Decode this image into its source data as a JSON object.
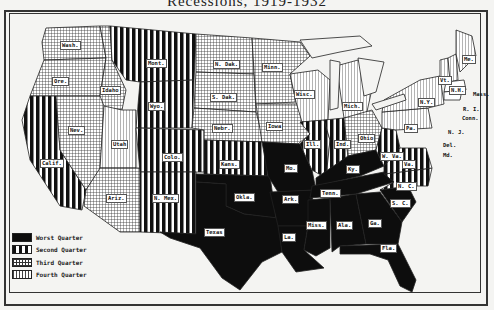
{
  "title": "Recessions, 1919-1932",
  "legend": [
    {
      "key": "worst",
      "label": "Worst Quarter"
    },
    {
      "key": "second",
      "label": "Second Quarter"
    },
    {
      "key": "third",
      "label": "Third Quarter"
    },
    {
      "key": "fourth",
      "label": "Fourth Quarter"
    }
  ],
  "states": [
    {
      "abbr": "Wash.",
      "quarter": "third"
    },
    {
      "abbr": "Ore.",
      "quarter": "third"
    },
    {
      "abbr": "Idaho",
      "quarter": "third"
    },
    {
      "abbr": "Calif.",
      "quarter": "second"
    },
    {
      "abbr": "Nev.",
      "quarter": "third"
    },
    {
      "abbr": "Mont.",
      "quarter": "second"
    },
    {
      "abbr": "Wyo.",
      "quarter": "second"
    },
    {
      "abbr": "Utah",
      "quarter": "fourth"
    },
    {
      "abbr": "Ariz.",
      "quarter": "third"
    },
    {
      "abbr": "Colo.",
      "quarter": "second"
    },
    {
      "abbr": "N. Mex.",
      "quarter": "second"
    },
    {
      "abbr": "N. Dak.",
      "quarter": "third"
    },
    {
      "abbr": "S. Dak.",
      "quarter": "third"
    },
    {
      "abbr": "Nebr.",
      "quarter": "third"
    },
    {
      "abbr": "Kans.",
      "quarter": "second"
    },
    {
      "abbr": "Okla.",
      "quarter": "worst"
    },
    {
      "abbr": "Texas",
      "quarter": "worst"
    },
    {
      "abbr": "Minn.",
      "quarter": "third"
    },
    {
      "abbr": "Iowa",
      "quarter": "third"
    },
    {
      "abbr": "Mo.",
      "quarter": "worst"
    },
    {
      "abbr": "Ark.",
      "quarter": "worst"
    },
    {
      "abbr": "La.",
      "quarter": "worst"
    },
    {
      "abbr": "Wisc.",
      "quarter": "fourth"
    },
    {
      "abbr": "Ill.",
      "quarter": "second"
    },
    {
      "abbr": "Ind.",
      "quarter": "second"
    },
    {
      "abbr": "Mich.",
      "quarter": "fourth"
    },
    {
      "abbr": "Ohio",
      "quarter": "third"
    },
    {
      "abbr": "Ky.",
      "quarter": "worst"
    },
    {
      "abbr": "Tenn.",
      "quarter": "worst"
    },
    {
      "abbr": "Miss.",
      "quarter": "worst"
    },
    {
      "abbr": "Ala.",
      "quarter": "worst"
    },
    {
      "abbr": "Ga.",
      "quarter": "worst"
    },
    {
      "abbr": "Fla.",
      "quarter": "worst"
    },
    {
      "abbr": "S. C.",
      "quarter": "worst"
    },
    {
      "abbr": "N. C.",
      "quarter": "second"
    },
    {
      "abbr": "Va.",
      "quarter": "second"
    },
    {
      "abbr": "W. Va.",
      "quarter": "second"
    },
    {
      "abbr": "Pa.",
      "quarter": "fourth"
    },
    {
      "abbr": "N.Y.",
      "quarter": "fourth"
    },
    {
      "abbr": "Vt.",
      "quarter": "fourth"
    },
    {
      "abbr": "N.H.",
      "quarter": "fourth"
    },
    {
      "abbr": "Me.",
      "quarter": "fourth"
    }
  ],
  "outside_labels": [
    "Mass.",
    "R. I.",
    "Conn.",
    "N. J.",
    "Del.",
    "Md."
  ]
}
